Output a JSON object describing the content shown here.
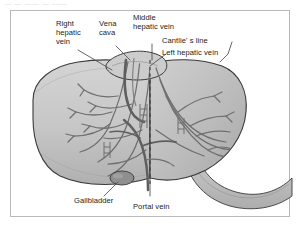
{
  "figure": {
    "type": "anatomical-diagram",
    "top_caption": "— —   —— —   ——",
    "frame": {
      "border_color": "#b9b9b9",
      "background": "#ffffff"
    }
  },
  "labels": {
    "right_hepatic_vein": "Right\nhepatic\nvein",
    "vena_cava": "Vena\ncava",
    "middle_hepatic_vein": "Middle\nhepatic vein",
    "cantlies_line": "Cantlie' s line",
    "left_hepatic_vein": "Left hepatic vein",
    "gallbladder": "Gallbladder",
    "portal_vein": "Portal vein"
  },
  "colors": {
    "liver_right_lobe": "#c6c6c6",
    "liver_left_lobe": "#b6b6b6",
    "liver_highlight": "#d8d8d8",
    "liver_shadow": "#a8a8a8",
    "gallbladder": "#8f8f8f",
    "duodenum": "#c0c0c0",
    "vessel_stroke": "#6f6f6f",
    "outline": "#3a3a3a",
    "label_text": "#1b1b1b",
    "leader_line": "#4a4a4a",
    "cantlie_dash": "#3a3a3a"
  },
  "structures": [
    {
      "name": "right-hepatic-vein",
      "kind": "vein"
    },
    {
      "name": "middle-hepatic-vein",
      "kind": "vein"
    },
    {
      "name": "left-hepatic-vein",
      "kind": "vein"
    },
    {
      "name": "inferior-vena-cava",
      "kind": "vein"
    },
    {
      "name": "portal-vein",
      "kind": "vein"
    },
    {
      "name": "gallbladder",
      "kind": "organ"
    },
    {
      "name": "duodenum",
      "kind": "organ"
    },
    {
      "name": "cantlies-line",
      "kind": "landmark",
      "style": "dashed"
    }
  ]
}
